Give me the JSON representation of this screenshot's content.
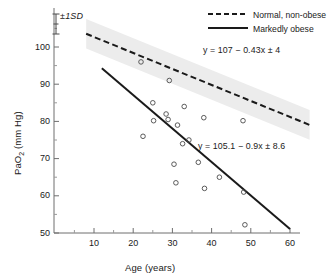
{
  "chart_data": {
    "type": "scatter",
    "title": "",
    "xlabel": "Age (years)",
    "ylabel": "PaO2 (mm Hg)",
    "ylabel_html": "PaO<sub>2</sub> (mm Hg)",
    "xlim": [
      3,
      63
    ],
    "ylim": [
      48,
      106
    ],
    "xticks": [
      10,
      20,
      30,
      40,
      50,
      60
    ],
    "yticks": [
      50,
      60,
      70,
      80,
      90,
      100
    ],
    "x_minor_ticks": [
      5,
      15,
      25,
      35,
      45,
      55
    ],
    "y_minor_ticks": [
      55,
      65,
      75,
      85,
      95,
      105
    ],
    "grid": false,
    "legend_position": "top-right",
    "annotations": {
      "sd_marker": "±1SD",
      "equation_normal": "y = 107 − 0.43x ± 4",
      "equation_obese": "y = 105.1 − 0.9x ± 8.6"
    },
    "series": [
      {
        "name": "Normal, non-obese",
        "style": "dashed-line",
        "color": "#1a1a1a",
        "equation": "y = 107 − 0.43x ± 4",
        "intercept": 107,
        "slope": -0.43,
        "sd": 4,
        "line_x_range": [
          8,
          65
        ],
        "band_fill": "#ececec",
        "band_label": "±1SD"
      },
      {
        "name": "Markedly obese",
        "style": "solid-line",
        "color": "#1a1a1a",
        "equation": "y = 105.1 − 0.9x ± 8.6",
        "intercept": 105.1,
        "slope": -0.9,
        "sd": 8.6,
        "line_x_range": [
          12,
          60
        ],
        "marker": "open-circle",
        "points": [
          {
            "x": 22.0,
            "y": 96.0
          },
          {
            "x": 22.5,
            "y": 76.0
          },
          {
            "x": 25.0,
            "y": 85.0
          },
          {
            "x": 25.2,
            "y": 80.2
          },
          {
            "x": 28.4,
            "y": 82.0
          },
          {
            "x": 28.9,
            "y": 80.5
          },
          {
            "x": 29.2,
            "y": 91.0
          },
          {
            "x": 30.4,
            "y": 68.5
          },
          {
            "x": 30.9,
            "y": 63.5
          },
          {
            "x": 31.3,
            "y": 79.0
          },
          {
            "x": 32.6,
            "y": 74.0
          },
          {
            "x": 33.0,
            "y": 84.0
          },
          {
            "x": 34.2,
            "y": 75.0
          },
          {
            "x": 36.6,
            "y": 69.0
          },
          {
            "x": 38.0,
            "y": 81.0
          },
          {
            "x": 38.2,
            "y": 62.0
          },
          {
            "x": 42.0,
            "y": 65.0
          },
          {
            "x": 48.0,
            "y": 80.2
          },
          {
            "x": 48.2,
            "y": 61.0
          },
          {
            "x": 48.5,
            "y": 52.2
          }
        ]
      }
    ]
  },
  "legend": {
    "items": [
      {
        "label": "Normal, non-obese",
        "style": "dashed"
      },
      {
        "label": "Markedly obese",
        "style": "solid"
      }
    ]
  },
  "axes": {
    "x_title": "Age (years)",
    "y_title_main": "PaO",
    "y_title_sub": "2",
    "y_title_unit": " (mm Hg)"
  },
  "colors": {
    "line": "#1a1a1a",
    "band": "#ececec",
    "marker_stroke": "#4a4a4a",
    "axis": "#6e6e6e",
    "text": "#1a1a1a"
  }
}
